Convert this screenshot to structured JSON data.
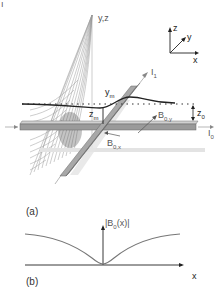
{
  "figure": {
    "panel_a": {
      "label": "(a)",
      "plane_label": "y,z",
      "axes": {
        "z": "z",
        "y": "y",
        "x": "x"
      },
      "wire_labels": {
        "i1": "I",
        "i1_sub": "1",
        "i0": "I",
        "i0_sub": "0"
      },
      "field_labels": {
        "b0y": "B",
        "b0y_sub": "0,y",
        "b0x": "B",
        "b0x_sub": "0,x"
      },
      "heights": {
        "ym": "y",
        "ym_sub": "m",
        "zm": "z",
        "zm_sub": "m",
        "z0": "z",
        "z0_sub": "0"
      }
    },
    "panel_b": {
      "label": "(b)",
      "ylabel": "|B0(x)|",
      "ylabel_main": "|B",
      "ylabel_sub": "0",
      "ylabel_tail": "(x)|",
      "xlabel": "x"
    },
    "colors": {
      "wire_top": "#b8b8b8",
      "wire_side": "#8c8c8c",
      "curve": "#222222",
      "field_lines": "#9a9a9a",
      "shadow": "#e3e3e3"
    }
  }
}
